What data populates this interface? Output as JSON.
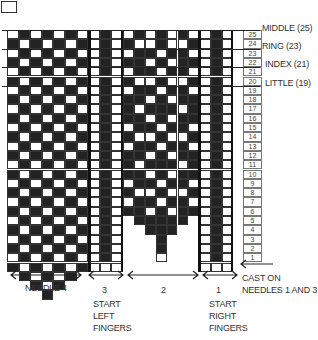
{
  "diagram": {
    "type": "knitting-chart",
    "rows": 25,
    "row_numbers": [
      "25",
      "24",
      "23",
      "22",
      "21",
      "20",
      "19",
      "18",
      "17",
      "16",
      "15",
      "14",
      "13",
      "12",
      "11",
      "10",
      "9",
      "8",
      "7",
      "6",
      "5",
      "4",
      "3",
      "2",
      "1"
    ],
    "finger_markers": [
      {
        "label": "MIDDLE (25)",
        "row": 25
      },
      {
        "label": "RING (23)",
        "row": 23
      },
      {
        "label": "INDEX (21)",
        "row": 21
      },
      {
        "label": "LITTLE (19)",
        "row": 19
      }
    ],
    "needles": [
      {
        "id": "needle-4",
        "label": "NEEDLE  4",
        "sublabel": ""
      },
      {
        "id": "needle-3",
        "label": "3",
        "sublabel": "START\nLEFT\nFINGERS"
      },
      {
        "id": "needle-2",
        "label": "2",
        "sublabel": ""
      },
      {
        "id": "needle-1",
        "label": "1",
        "sublabel": "START\nRIGHT\nFINGERS"
      }
    ],
    "cast_on_label": "CAST ON\nNEEDLES 1 AND 3",
    "colors": {
      "dark": "#222222",
      "light": "#ffffff",
      "line": "#333333"
    }
  }
}
